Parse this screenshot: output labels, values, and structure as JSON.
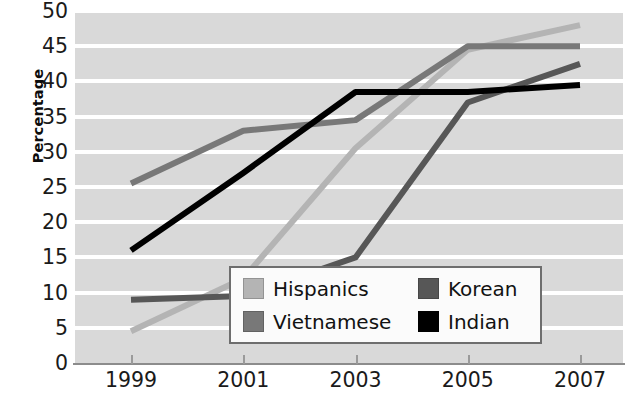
{
  "chart_data": {
    "type": "line",
    "title": "",
    "xlabel": "",
    "ylabel": "Percentage",
    "x": [
      1999,
      2001,
      2003,
      2005,
      2007
    ],
    "categories": [
      "1999",
      "2001",
      "2003",
      "2005",
      "2007"
    ],
    "xlim": [
      1999,
      2007
    ],
    "ylim": [
      0,
      50
    ],
    "y_ticks": [
      0,
      5,
      10,
      15,
      20,
      25,
      30,
      35,
      40,
      45,
      50
    ],
    "y_tick_labels": [
      "0",
      "5",
      "10",
      "15",
      "20",
      "25",
      "30",
      "35",
      "40",
      "45",
      "50"
    ],
    "x_ticks": [
      1999,
      2001,
      2003,
      2005,
      2007
    ],
    "x_tick_labels": [
      "1999",
      "2001",
      "2003",
      "2005",
      "2007"
    ],
    "grid": true,
    "grid_axis": "y",
    "plot_background": "#d9d9d9",
    "gridline_color": "#ffffff",
    "legend_position": "lower-right-inside",
    "series": [
      {
        "name": "Hispanics",
        "color": "#b4b4b4",
        "values": [
          4.5,
          12,
          30.5,
          44.5,
          48
        ]
      },
      {
        "name": "Vietnamese",
        "color": "#787878",
        "values": [
          25.5,
          33,
          34.5,
          45,
          45
        ]
      },
      {
        "name": "Korean",
        "color": "#575757",
        "values": [
          9,
          9.5,
          15,
          37,
          42.5
        ]
      },
      {
        "name": "Indian",
        "color": "#000000",
        "values": [
          16,
          27,
          38.5,
          38.5,
          39.5
        ]
      }
    ]
  },
  "legend": {
    "entries": [
      {
        "label": "Hispanics",
        "color": "#b4b4b4"
      },
      {
        "label": "Korean",
        "color": "#575757"
      },
      {
        "label": "Vietnamese",
        "color": "#787878"
      },
      {
        "label": "Indian",
        "color": "#000000"
      }
    ]
  },
  "axes": {
    "y_title": "Percentage"
  }
}
